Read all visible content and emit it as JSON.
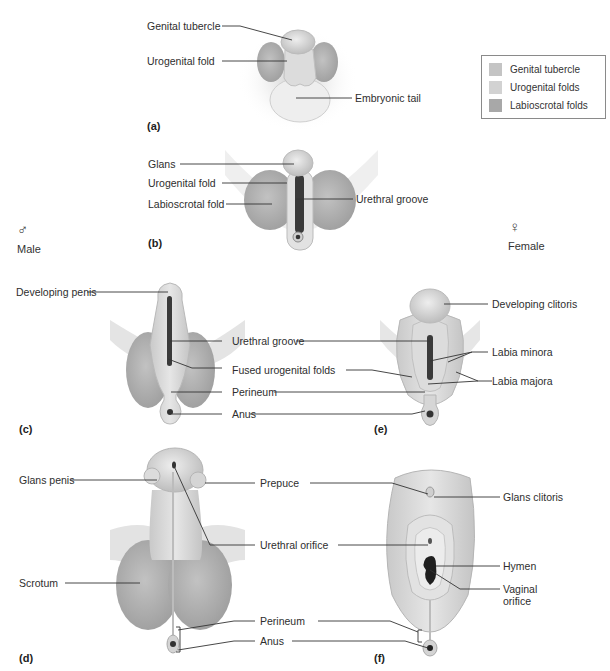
{
  "figure": {
    "sexes": {
      "male": {
        "symbol": "♂",
        "label": "Male"
      },
      "female": {
        "symbol": "♀",
        "label": "Female"
      }
    },
    "legend": {
      "items": [
        {
          "label": "Genital tubercle",
          "color": "#c4c4c4"
        },
        {
          "label": "Urogenital folds",
          "color": "#d2d2d2"
        },
        {
          "label": "Labioscrotal folds",
          "color": "#a8a8a8"
        }
      ]
    },
    "panels": {
      "a": {
        "letter": "(a)",
        "labels": [
          "Genital tubercle",
          "Urogenital fold",
          "Embryonic tail"
        ]
      },
      "b": {
        "letter": "(b)",
        "labels": [
          "Glans",
          "Urogenital fold",
          "Labioscrotal fold",
          "Urethral groove"
        ]
      },
      "c": {
        "letter": "(c)",
        "labels": [
          "Developing penis"
        ]
      },
      "ce_shared": {
        "labels": [
          "Urethral groove",
          "Fused urogenital folds",
          "Perineum",
          "Anus"
        ]
      },
      "e": {
        "letter": "(e)",
        "labels": [
          "Developing clitoris",
          "Labia minora",
          "Labia majora"
        ]
      },
      "d": {
        "letter": "(d)",
        "labels": [
          "Glans penis",
          "Scrotum"
        ]
      },
      "df_shared": {
        "labels": [
          "Prepuce",
          "Urethral orifice",
          "Perineum",
          "Anus"
        ]
      },
      "f": {
        "letter": "(f)",
        "labels": [
          "Glans clitoris",
          "Hymen",
          "Vaginal orifice"
        ]
      }
    }
  }
}
